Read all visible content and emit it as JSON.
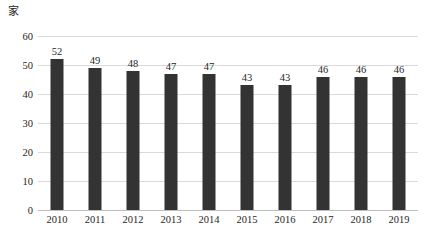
{
  "chart_data": {
    "type": "bar",
    "title": "",
    "subtitle": "",
    "xlabel": "",
    "ylabel": "家",
    "unit_label": "家",
    "categories": [
      "2010",
      "2011",
      "2012",
      "2013",
      "2014",
      "2015",
      "2016",
      "2017",
      "2018",
      "2019"
    ],
    "values": [
      52,
      49,
      48,
      47,
      47,
      43,
      43,
      46,
      46,
      46
    ],
    "data_labels": [
      "52",
      "49",
      "48",
      "47",
      "47",
      "43",
      "43",
      "46",
      "46",
      "46"
    ],
    "ylim": [
      0,
      60
    ],
    "ytick_values": [
      60,
      50,
      40,
      30,
      20,
      10,
      0
    ],
    "ytick_labels": [
      "60",
      "50",
      "40",
      "30",
      "20",
      "10",
      "0"
    ],
    "grid": true,
    "legend": false,
    "legend_position": "none",
    "series": [
      {
        "name": "",
        "values": [
          52,
          49,
          48,
          47,
          47,
          43,
          43,
          46,
          46,
          46
        ],
        "color": "#333333"
      }
    ],
    "colors": {
      "bar": "#333333",
      "gridline": "#d9d9d9",
      "axis": "#bfbfbf",
      "text": "#262626",
      "background": "#ffffff"
    }
  }
}
